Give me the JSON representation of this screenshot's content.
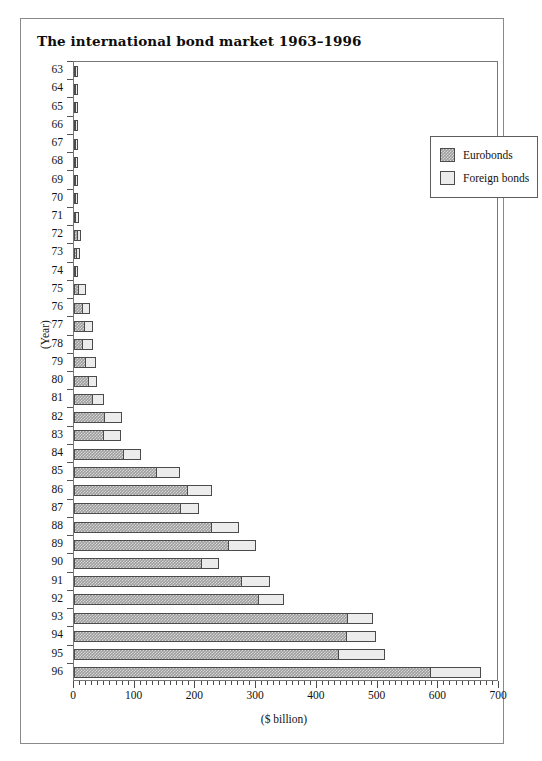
{
  "figure": {
    "title": "The international bond market 1963–1996"
  },
  "legend": {
    "position": "top-right",
    "entries": [
      {
        "label": "Eurobonds",
        "color": "#9d9d9d",
        "swatch": "eurobonds-swatch"
      },
      {
        "label": "Foreign bonds",
        "color": "#ececec",
        "swatch": "foreign-bonds-swatch"
      }
    ]
  },
  "axes": {
    "x_title": "($ billion)",
    "y_title": "(Year)",
    "x_ticks": [
      "0",
      "100",
      "200",
      "300",
      "400",
      "500",
      "600",
      "700"
    ],
    "x_minor_step": 10
  },
  "chart_data": {
    "type": "bar",
    "orientation": "horizontal",
    "stacked": true,
    "title": "The international bond market 1963–1996",
    "xlabel": "($ billion)",
    "ylabel": "(Year)",
    "xlim": [
      0,
      700
    ],
    "grid": false,
    "legend_position": "top-right",
    "categories": [
      "63",
      "64",
      "65",
      "66",
      "67",
      "68",
      "69",
      "70",
      "71",
      "72",
      "73",
      "74",
      "75",
      "76",
      "77",
      "78",
      "79",
      "80",
      "81",
      "82",
      "83",
      "84",
      "85",
      "86",
      "87",
      "88",
      "89",
      "90",
      "91",
      "92",
      "93",
      "94",
      "95",
      "96"
    ],
    "series": [
      {
        "name": "Eurobonds",
        "color": "#9d9d9d",
        "values": [
          1,
          1,
          1,
          1,
          2,
          3,
          3,
          3,
          4,
          6,
          5,
          2,
          9,
          15,
          18,
          14,
          19,
          24,
          32,
          51,
          50,
          82,
          136,
          188,
          177,
          227,
          255,
          210,
          276,
          304,
          451,
          450,
          436,
          588
        ]
      },
      {
        "name": "Foreign bonds",
        "color": "#ececec",
        "values": [
          1,
          1,
          1,
          1,
          2,
          3,
          3,
          3,
          4,
          6,
          5,
          4,
          10,
          12,
          13,
          18,
          17,
          14,
          18,
          28,
          27,
          28,
          39,
          40,
          29,
          45,
          45,
          28,
          47,
          42,
          41,
          48,
          76,
          82
        ]
      }
    ],
    "totals": [
      2,
      2,
      2,
      2,
      4,
      6,
      6,
      6,
      8,
      12,
      10,
      6,
      19,
      27,
      31,
      32,
      36,
      38,
      50,
      79,
      77,
      110,
      175,
      228,
      206,
      272,
      300,
      238,
      323,
      346,
      492,
      498,
      512,
      670
    ]
  }
}
